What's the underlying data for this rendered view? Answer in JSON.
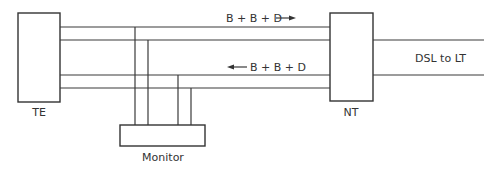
{
  "diagram": {
    "type": "ISDN BRI monitoring setup",
    "nodes": {
      "te": {
        "label": "TE"
      },
      "nt": {
        "label": "NT"
      },
      "monitor": {
        "label": "Monitor"
      }
    },
    "channels": {
      "upstream": {
        "label": "B + B + D",
        "direction": "right"
      },
      "downstream": {
        "label": "B + B + D",
        "direction": "left"
      }
    },
    "external_link": {
      "label": "DSL to LT"
    },
    "colors": {
      "line": "#3a3a3a",
      "text": "#333333",
      "background": "#ffffff"
    }
  }
}
